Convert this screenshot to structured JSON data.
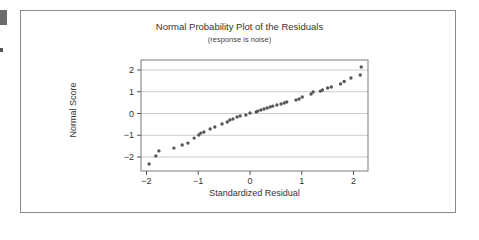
{
  "chart_data": {
    "type": "scatter",
    "title": "Normal Probability Plot of the Residuals",
    "subtitle": "(response is noise)",
    "xlabel": "Standardized Residual",
    "ylabel": "Normal Score",
    "xlim": [
      -2.1,
      2.3
    ],
    "ylim": [
      -2.6,
      2.5
    ],
    "xticks": [
      -2,
      -1,
      0,
      1,
      2
    ],
    "yticks": [
      -2,
      -1,
      0,
      1,
      2
    ],
    "xtick_labels": [
      "−2",
      "−1",
      "0",
      "1",
      "2"
    ],
    "ytick_labels": [
      "−2",
      "−1",
      "0",
      "1",
      "2"
    ],
    "grid": "horizontal",
    "legend": null,
    "point_color": "#555555",
    "points": [
      [
        -1.95,
        -2.32
      ],
      [
        -1.82,
        -1.95
      ],
      [
        -1.76,
        -1.72
      ],
      [
        -1.47,
        -1.59
      ],
      [
        -1.31,
        -1.45
      ],
      [
        -1.2,
        -1.36
      ],
      [
        -1.08,
        -1.13
      ],
      [
        -0.99,
        -0.99
      ],
      [
        -0.95,
        -0.9
      ],
      [
        -0.89,
        -0.85
      ],
      [
        -0.77,
        -0.71
      ],
      [
        -0.68,
        -0.62
      ],
      [
        -0.54,
        -0.48
      ],
      [
        -0.44,
        -0.39
      ],
      [
        -0.39,
        -0.3
      ],
      [
        -0.33,
        -0.25
      ],
      [
        -0.25,
        -0.16
      ],
      [
        -0.19,
        -0.11
      ],
      [
        -0.08,
        -0.07
      ],
      [
        0.0,
        0.02
      ],
      [
        0.12,
        0.07
      ],
      [
        0.15,
        0.11
      ],
      [
        0.21,
        0.16
      ],
      [
        0.27,
        0.21
      ],
      [
        0.33,
        0.25
      ],
      [
        0.39,
        0.3
      ],
      [
        0.44,
        0.34
      ],
      [
        0.52,
        0.39
      ],
      [
        0.6,
        0.44
      ],
      [
        0.66,
        0.48
      ],
      [
        0.71,
        0.53
      ],
      [
        0.89,
        0.62
      ],
      [
        0.95,
        0.67
      ],
      [
        1.01,
        0.76
      ],
      [
        1.18,
        0.9
      ],
      [
        1.22,
        0.99
      ],
      [
        1.36,
        1.03
      ],
      [
        1.4,
        1.08
      ],
      [
        1.5,
        1.17
      ],
      [
        1.57,
        1.22
      ],
      [
        1.75,
        1.36
      ],
      [
        1.82,
        1.47
      ],
      [
        1.95,
        1.63
      ],
      [
        2.13,
        1.77
      ],
      [
        2.15,
        2.14
      ]
    ]
  },
  "figure": {
    "title": "Normal Probability Plot of the Residuals",
    "subtitle": "(response is noise)",
    "xlabel": "Standardized Residual",
    "ylabel": "Normal Score"
  }
}
